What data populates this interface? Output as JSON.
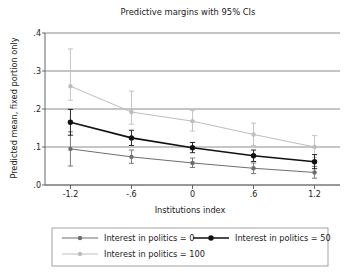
{
  "chart_data": {
    "type": "line",
    "title": "Predictive margins with 95% CIs",
    "xlabel": "Institutions index",
    "ylabel": "Predicted mean, fixed portion only",
    "x": [
      -1.2,
      -0.6,
      0,
      0.6,
      1.2
    ],
    "xticklabels": [
      "-1.2",
      "-.6",
      "0",
      ".6",
      "1.2"
    ],
    "yticklabels": [
      ".0",
      ".1",
      ".2",
      ".3",
      ".4"
    ],
    "yticks": [
      0,
      0.1,
      0.2,
      0.3,
      0.4
    ],
    "xlim": [
      -1.45,
      1.45
    ],
    "ylim": [
      0,
      0.4
    ],
    "grid": true,
    "grid_axis": "y",
    "legend_position": "bottom",
    "error_bars": "95% CI",
    "series": [
      {
        "name": "Interest in politics = 0",
        "color": "#6e6e6e",
        "marker": "circle",
        "values": [
          0.095,
          0.074,
          0.058,
          0.044,
          0.033
        ],
        "ci_low": [
          0.05,
          0.057,
          0.046,
          0.03,
          0.018
        ],
        "ci_high": [
          0.14,
          0.092,
          0.071,
          0.058,
          0.049
        ]
      },
      {
        "name": "Interest in politics = 50",
        "color": "#111111",
        "marker": "circle",
        "values": [
          0.165,
          0.124,
          0.098,
          0.077,
          0.061
        ],
        "ci_low": [
          0.131,
          0.104,
          0.085,
          0.062,
          0.043
        ],
        "ci_high": [
          0.199,
          0.144,
          0.112,
          0.092,
          0.08
        ]
      },
      {
        "name": "Interest in politics = 100",
        "color": "#bdbdbd",
        "marker": "circle",
        "values": [
          0.26,
          0.192,
          0.168,
          0.133,
          0.1
        ],
        "ci_low": [
          0.223,
          0.16,
          0.142,
          0.104,
          0.072
        ],
        "ci_high": [
          0.358,
          0.247,
          0.196,
          0.163,
          0.13
        ]
      }
    ]
  },
  "legend": {
    "items": [
      {
        "label": "Interest in politics = 0"
      },
      {
        "label": "Interest in politics = 50"
      },
      {
        "label": "Interest in politics = 100"
      }
    ]
  }
}
